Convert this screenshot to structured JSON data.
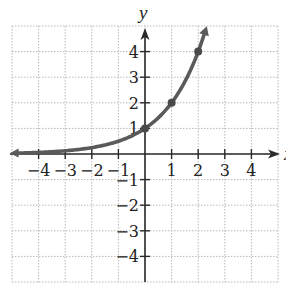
{
  "chart_data": {
    "type": "line",
    "title": "",
    "function": "y = 2^x",
    "xlabel": "x",
    "ylabel": "y",
    "xlim": [
      -5,
      5
    ],
    "ylim": [
      -5,
      5
    ],
    "grid": true,
    "x_ticks": [
      -4,
      -3,
      -2,
      -1,
      1,
      2,
      3,
      4
    ],
    "y_ticks": [
      4,
      3,
      2,
      1,
      -1,
      -2,
      -3,
      -4
    ],
    "x_tick_labels": [
      "−4",
      "−3",
      "−2",
      "−1",
      "1",
      "2",
      "3",
      "4"
    ],
    "y_tick_labels": [
      "4",
      "3",
      "2",
      "1",
      "−1",
      "−2",
      "−3",
      "−4"
    ],
    "series": [
      {
        "name": "y = 2^x",
        "x": [
          -5,
          -4,
          -3,
          -2,
          -1,
          0,
          1,
          2,
          2.3
        ],
        "y": [
          0.03,
          0.06,
          0.125,
          0.25,
          0.5,
          1,
          2,
          4,
          4.9
        ],
        "color": "#5a5a5a"
      }
    ],
    "highlighted_points": [
      {
        "x": 0,
        "y": 1
      },
      {
        "x": 1,
        "y": 2
      },
      {
        "x": 2,
        "y": 4
      }
    ]
  },
  "labels": {
    "x_axis": "x",
    "y_axis": "y"
  }
}
